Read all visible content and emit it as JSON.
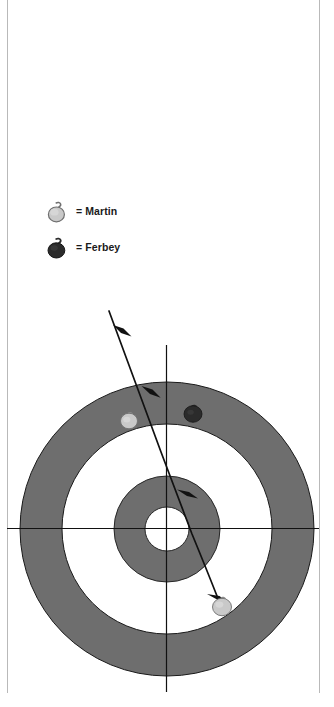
{
  "page": {
    "background_color": "#ffffff",
    "rule_color": "#b9b9b9",
    "width": 334,
    "height": 707
  },
  "legend": {
    "title": "",
    "items": [
      {
        "id": "martin",
        "label": "= Martin",
        "player": "Martin",
        "icon": "curling-stone-icon",
        "stone_color": "#c9c9c9",
        "stone_edge": "#6f6f6f",
        "handle_color": "#dcdcdc"
      },
      {
        "id": "ferbey",
        "label": "= Ferbey",
        "player": "Ferbey",
        "icon": "curling-stone-icon",
        "stone_color": "#2b2b2b",
        "stone_edge": "#141414",
        "handle_color": "#3a3a3a"
      }
    ]
  },
  "house": {
    "center": {
      "x": 167,
      "y": 529
    },
    "rings": [
      {
        "name": "twelve-foot",
        "radius": 147,
        "fill": "#6e6e6e",
        "stroke": "#1a1a1a"
      },
      {
        "name": "eight-foot",
        "radius": 105,
        "fill": "#ffffff",
        "stroke": "#1a1a1a"
      },
      {
        "name": "four-foot",
        "radius": 53,
        "fill": "#6e6e6e",
        "stroke": "#1a1a1a"
      },
      {
        "name": "button",
        "radius": 22,
        "fill": "#ffffff",
        "stroke": "#1a1a1a"
      }
    ],
    "axes": {
      "center_line_color": "#111111",
      "tee_line": {
        "y": 529,
        "x1": 7,
        "x2": 319
      },
      "center_line": {
        "x": 167,
        "y1": 345,
        "y2": 692
      }
    },
    "stones": [
      {
        "id": "stone-martin-guard",
        "player": "Martin",
        "x": 129,
        "y": 421,
        "r": 8.5,
        "color": "#c9c9c9",
        "edge": "#6f6f6f",
        "zone": "twelve-foot"
      },
      {
        "id": "stone-ferbey-top",
        "player": "Ferbey",
        "x": 193,
        "y": 414,
        "r": 9.0,
        "color": "#2b2b2b",
        "edge": "#141414",
        "zone": "twelve-foot"
      },
      {
        "id": "stone-martin-shooter",
        "player": "Martin",
        "x": 222,
        "y": 607,
        "r": 9.5,
        "color": "#c9c9c9",
        "edge": "#6f6f6f",
        "zone": "twelve-foot"
      }
    ],
    "trajectory": {
      "name": "shot-path",
      "color": "#111111",
      "points": [
        {
          "x": 109,
          "y": 311
        },
        {
          "x": 165,
          "y": 463
        },
        {
          "x": 188,
          "y": 522
        },
        {
          "x": 215,
          "y": 593
        }
      ],
      "arrowheads": [
        {
          "x": 121,
          "y": 332,
          "angle": 70
        },
        {
          "x": 148,
          "y": 391,
          "angle": 68
        },
        {
          "x": 184,
          "y": 491,
          "angle": 69
        },
        {
          "x": 216,
          "y": 596,
          "angle": 69
        }
      ]
    }
  }
}
